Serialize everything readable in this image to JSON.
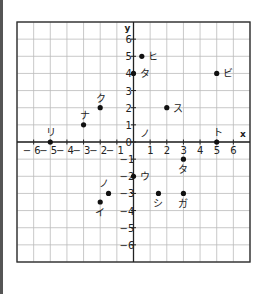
{
  "chart_data": {
    "type": "scatter",
    "title": "",
    "xlabel": "x",
    "ylabel": "y",
    "xlim": [
      -7,
      7
    ],
    "ylim": [
      -7,
      7
    ],
    "grid": true,
    "x_ticks": [
      -6,
      -5,
      -4,
      -3,
      -2,
      -1,
      1,
      2,
      3,
      4,
      5,
      6
    ],
    "y_ticks": [
      -6,
      -5,
      -4,
      -3,
      -2,
      -1,
      0,
      1,
      2,
      3,
      4,
      5,
      6
    ],
    "origin_label": "0",
    "points": [
      {
        "label": "ヒ",
        "x": 0.5,
        "y": 5,
        "label_pos": "right"
      },
      {
        "label": "タ",
        "x": 0,
        "y": 4,
        "label_pos": "right"
      },
      {
        "label": "ビ",
        "x": 5,
        "y": 4,
        "label_pos": "right"
      },
      {
        "label": "ク",
        "x": -2,
        "y": 2,
        "label_pos": "above"
      },
      {
        "label": "ス",
        "x": 2,
        "y": 2,
        "label_pos": "right"
      },
      {
        "label": "ナ",
        "x": -3,
        "y": 1,
        "label_pos": "above"
      },
      {
        "label": "リ",
        "x": -5,
        "y": 0,
        "label_pos": "above"
      },
      {
        "label": "ト",
        "x": 5,
        "y": 0,
        "label_pos": "above"
      },
      {
        "label": "タ",
        "x": 3,
        "y": -1,
        "label_pos": "below"
      },
      {
        "label": "ウ",
        "x": 0,
        "y": -2,
        "label_pos": "right"
      },
      {
        "label": "ノ",
        "x": -1.5,
        "y": -3,
        "label_pos": "above-left"
      },
      {
        "label": "シ",
        "x": 1.5,
        "y": -3,
        "label_pos": "below"
      },
      {
        "label": "ガ",
        "x": 3,
        "y": -3,
        "label_pos": "below"
      },
      {
        "label": "イ",
        "x": -2,
        "y": -3.5,
        "label_pos": "below"
      }
    ],
    "free_labels": [
      {
        "label": "ノ",
        "x": 0.5,
        "y": 0.5
      }
    ]
  }
}
